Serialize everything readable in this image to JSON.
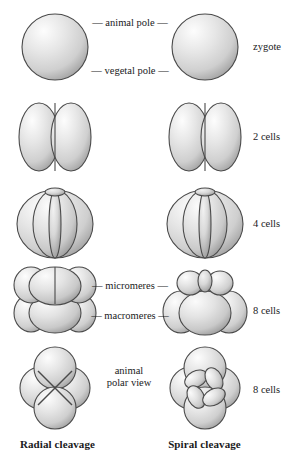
{
  "figure": {
    "background_color": "#ffffff",
    "ink_color": "#1a1a1c",
    "cell_fill_light": "#fcfcfc",
    "cell_fill_mid": "#dcdcdc",
    "cell_fill_dark": "#b0b0b0",
    "cell_outline": "#4a4a4a"
  },
  "center_labels": {
    "animal_pole": "— animal pole —",
    "vegetal_pole": "— vegetal pole —",
    "micromeres": "— micromeres —",
    "macromeres": "— macromeres —",
    "animal_polar_view": "animal polar view"
  },
  "stage_labels": [
    {
      "label": "zygote"
    },
    {
      "label": "2 cells"
    },
    {
      "label": "4 cells"
    },
    {
      "label": "8 cells"
    },
    {
      "label": "8 cells"
    }
  ],
  "column_captions": {
    "left": "Radial cleavage",
    "right": "Spiral cleavage"
  },
  "rows": [
    {
      "name": "zygote-row",
      "stage": "zygote",
      "left_view": "single-sphere",
      "right_view": "single-sphere",
      "cell_count": 1
    },
    {
      "name": "two-cell-row",
      "stage": "2 cells",
      "left_view": "two-lobe-side",
      "right_view": "two-lobe-side",
      "cell_count": 2
    },
    {
      "name": "four-cell-row",
      "stage": "4 cells",
      "left_view": "four-lobe-barrel",
      "right_view": "four-lobe-barrel",
      "cell_count": 4
    },
    {
      "name": "eight-cell-row",
      "stage": "8 cells",
      "left_view": "radial-stacked-tiers",
      "right_view": "spiral-offset-tiers",
      "cell_count": 8
    },
    {
      "name": "polar-view-row",
      "stage": "8 cells",
      "left_view": "radial-animal-polar-cross",
      "right_view": "spiral-animal-polar-pinwheel",
      "cell_count": 8
    }
  ]
}
